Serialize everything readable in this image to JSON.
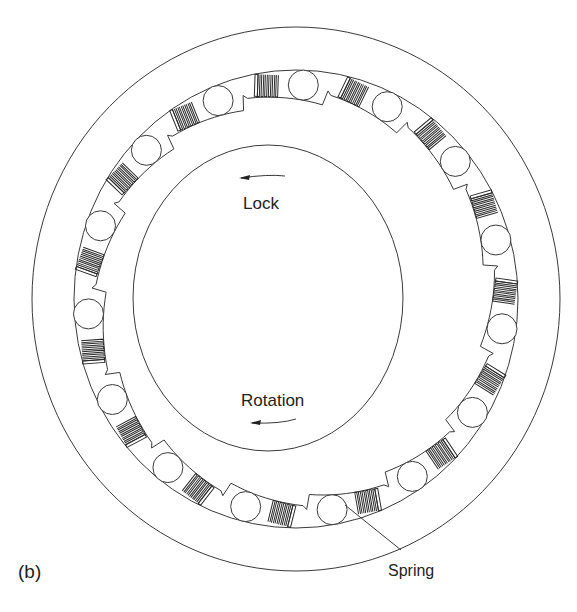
{
  "figure": {
    "panel_label": "(b)",
    "labels": {
      "lock": "Lock",
      "rotation": "Rotation",
      "spring": "Spring"
    },
    "components": {
      "outer_ring": "outer-ring",
      "outer_race": "outer-race",
      "inner_hub": "inner-hub",
      "roller_count": 15,
      "spring_count": 15
    },
    "arrows": {
      "lock_direction": "counterclockwise",
      "rotation_direction": "counterclockwise"
    },
    "colors": {
      "stroke": "#3a3a3a",
      "background": "#ffffff",
      "text": "#222222"
    }
  }
}
